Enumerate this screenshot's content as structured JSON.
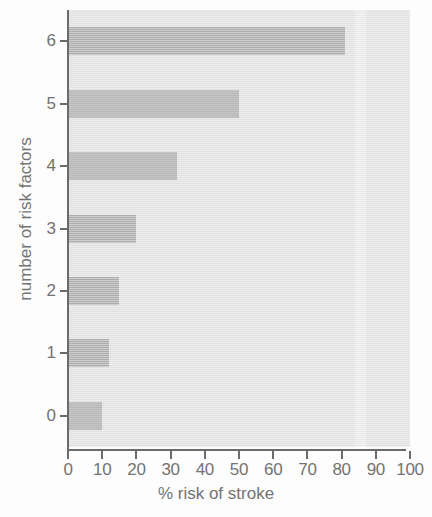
{
  "chart_data": {
    "type": "bar",
    "orientation": "horizontal",
    "title": "",
    "xlabel": "% risk of stroke",
    "ylabel": "number of risk factors",
    "categories": [
      "0",
      "1",
      "2",
      "3",
      "4",
      "5",
      "6"
    ],
    "values": [
      10,
      12,
      15,
      20,
      32,
      50,
      81
    ],
    "xlim": [
      0,
      100
    ],
    "x_ticks": [
      "0",
      "10",
      "20",
      "30",
      "40",
      "50",
      "60",
      "70",
      "80",
      "90",
      "100"
    ],
    "x_tick_values": [
      0,
      10,
      20,
      30,
      40,
      50,
      60,
      70,
      80,
      90,
      100
    ],
    "y_ticks": [
      "0",
      "1",
      "2",
      "3",
      "4",
      "5",
      "6"
    ],
    "grid": false,
    "legend": null,
    "colors": {
      "bar": "#b5b5b5",
      "plot_background": "#e6e6e6",
      "axis": "#6b6b6b",
      "text": "#737373",
      "figure_background": "#fdfdfd"
    }
  }
}
